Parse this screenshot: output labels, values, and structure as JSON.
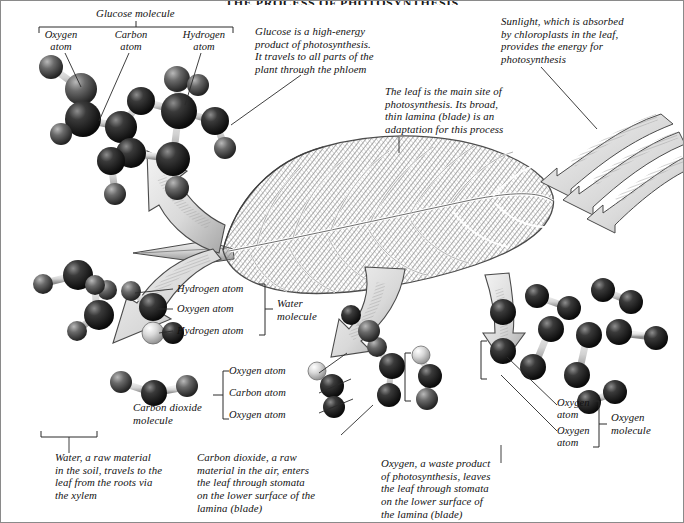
{
  "figure": {
    "title": "THE PROCESS OF PHOTOSYNTHESIS",
    "domain": "biology-diagram",
    "ink_color": "#2a2a2a",
    "paper_color": "#ffffff"
  },
  "top_group": {
    "group_label": "Glucose molecule",
    "atom_labels": [
      {
        "text": "Oxygen\natom"
      },
      {
        "text": "Carbon\natom"
      },
      {
        "text": "Hydrogen\natom"
      }
    ]
  },
  "annotations": {
    "glucose_note": "Glucose is a high-energy\nproduct of photosynthesis.\nIt travels to all parts of the\nplant through the phloem",
    "leaf_note": "The leaf is the main site of\nphotosynthesis. Its broad,\nthin lamina (blade) is an\nadaptation for this process",
    "sunlight_note": "Sunlight, which is absorbed\nby chloroplasts in the leaf,\nprovides the energy for\nphotosynthesis"
  },
  "water_group": {
    "atom_labels": [
      {
        "text": "Hydrogen atom"
      },
      {
        "text": "Oxygen atom"
      },
      {
        "text": "Hydrogen atom"
      }
    ],
    "group_label": "Water\nmolecule"
  },
  "co2_group": {
    "group_label": "Carbon dioxide\nmolecule",
    "atom_labels": [
      {
        "text": "Oxygen atom"
      },
      {
        "text": "Carbon atom"
      },
      {
        "text": "Oxygen atom"
      }
    ]
  },
  "oxygen_group": {
    "atom_labels": [
      {
        "text": "Oxygen\natom"
      },
      {
        "text": "Oxygen\natom"
      }
    ],
    "group_label": "Oxygen\nmolecule"
  },
  "captions": {
    "water": "Water, a raw material\nin the soil, travels to the\nleaf from the roots via\nthe xylem",
    "carbon_dioxide": "Carbon dioxide, a raw\nmaterial in the air, enters\nthe leaf through stomata\non the lower surface of the\nlamina (blade)",
    "oxygen": "Oxygen, a waste product\nof photosynthesis, leaves\nthe leaf through stomata\non the lower surface of\nthe lamina (blade)"
  }
}
